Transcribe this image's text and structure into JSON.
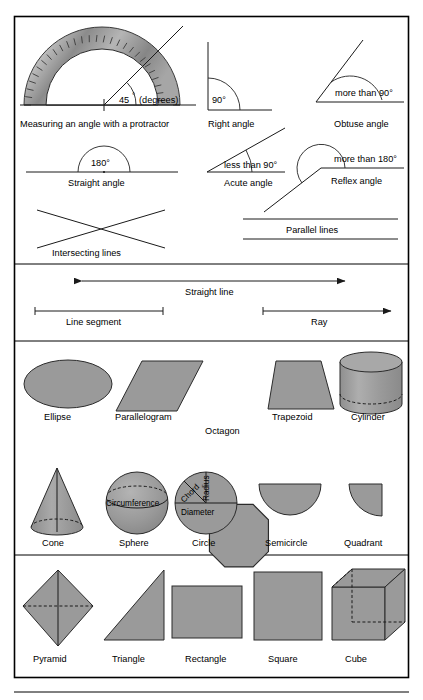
{
  "page": {
    "background_color": "#ffffff",
    "frame_color": "#000000",
    "shape_fill": "#9a9a9a",
    "line_color": "#1a1a1a"
  },
  "sections": {
    "angles": {
      "items": [
        {
          "id": "protractor",
          "caption": "Measuring an angle with a protractor",
          "value_label": "45",
          "degree_symbol": "°",
          "unit_note": "(degrees)"
        },
        {
          "id": "right-angle",
          "caption": "Right angle",
          "value_label": "90°"
        },
        {
          "id": "obtuse-angle",
          "caption": "Obtuse angle",
          "value_label": "more than 90°"
        },
        {
          "id": "straight-angle",
          "caption": "Straight angle",
          "value_label": "180°"
        },
        {
          "id": "acute-angle",
          "caption": "Acute angle",
          "value_label": "less than 90°"
        },
        {
          "id": "reflex-angle",
          "caption": "Reflex angle",
          "value_label": "more than 180°"
        },
        {
          "id": "intersecting-lines",
          "caption": "Intersecting lines",
          "value_label": ""
        },
        {
          "id": "parallel-lines",
          "caption": "Parallel lines",
          "value_label": ""
        }
      ]
    },
    "lines": {
      "items": [
        {
          "id": "straight-line",
          "caption": "Straight line",
          "arrows": "both"
        },
        {
          "id": "line-segment",
          "caption": "Line segment",
          "arrows": "none"
        },
        {
          "id": "ray",
          "caption": "Ray",
          "arrows": "right"
        }
      ]
    },
    "shapes_row_1": {
      "items": [
        {
          "id": "ellipse",
          "caption": "Ellipse"
        },
        {
          "id": "parallelogram",
          "caption": "Parallelogram"
        },
        {
          "id": "octagon",
          "caption": "Octagon"
        },
        {
          "id": "trapezoid",
          "caption": "Trapezoid"
        },
        {
          "id": "cylinder",
          "caption": "Cylinder"
        }
      ]
    },
    "shapes_row_2": {
      "items": [
        {
          "id": "cone",
          "caption": "Cone"
        },
        {
          "id": "sphere",
          "caption": "Sphere",
          "annotations": [
            "Circumference"
          ]
        },
        {
          "id": "circle",
          "caption": "Circle",
          "annotations": [
            "Chord",
            "Radius",
            "Diameter"
          ]
        },
        {
          "id": "semicircle",
          "caption": "Semicircle"
        },
        {
          "id": "quadrant",
          "caption": "Quadrant"
        }
      ]
    },
    "shapes_row_3": {
      "items": [
        {
          "id": "pyramid",
          "caption": "Pyramid"
        },
        {
          "id": "triangle",
          "caption": "Triangle"
        },
        {
          "id": "rectangle",
          "caption": "Rectangle"
        },
        {
          "id": "square",
          "caption": "Square"
        },
        {
          "id": "cube",
          "caption": "Cube"
        }
      ]
    }
  }
}
